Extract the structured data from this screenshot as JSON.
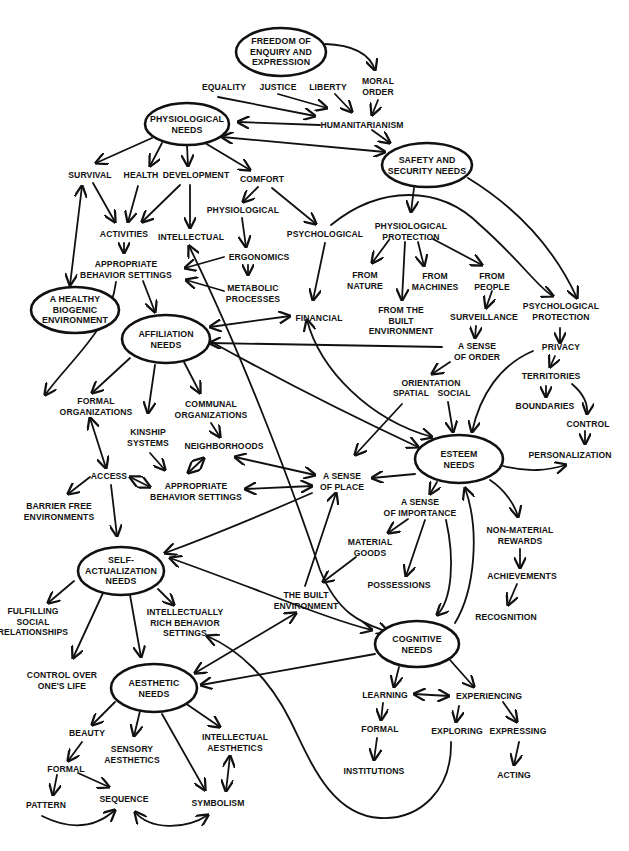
{
  "diagram": {
    "title": "",
    "colors": {
      "ink": "#111111",
      "background": "#ffffff"
    },
    "needs": {
      "freedom": "FREEDOM OF\nENQUIRY AND\nEXPRESSION",
      "physiological": "PHYSIOLOGICAL\nNEEDS",
      "safety": "SAFETY AND\nSECURITY NEEDS",
      "healthy_env": "A HEALTHY\nBIOGENIC\nENVIRONMENT",
      "affiliation": "AFFILIATION\nNEEDS",
      "esteem": "ESTEEM\nNEEDS",
      "self_actualization": "SELF-\nACTUALIZATION\nNEEDS",
      "cognitive": "COGNITIVE\nNEEDS",
      "aesthetic": "AESTHETIC\nNEEDS"
    },
    "labels": {
      "equality": "EQUALITY",
      "justice": "JUSTICE",
      "liberty": "LIBERTY",
      "moral_order": "MORAL\nORDER",
      "humanitarianism": "HUMANITARIANISM",
      "survival": "SURVIVAL",
      "health": "HEALTH",
      "development": "DEVELOPMENT",
      "comfort": "COMFORT",
      "comfort_physiological": "PHYSIOLOGICAL",
      "comfort_psychological": "PSYCHOLOGICAL",
      "activities": "ACTIVITIES",
      "intellectual": "INTELLECTUAL",
      "ergonomics": "ERGONOMICS",
      "metabolic": "METABOLIC\nPROCESSES",
      "appropriate_behavior_1": "APPROPRIATE\nBEHAVIOR SETTINGS",
      "financial": "FINANCIAL",
      "physiological_protection": "PHYSIOLOGICAL\nPROTECTION",
      "from_nature": "FROM\nNATURE",
      "from_built": "FROM THE\nBUILT\nENVIRONMENT",
      "from_machines": "FROM\nMACHINES",
      "from_people": "FROM\nPEOPLE",
      "surveillance": "SURVEILLANCE",
      "psychological_protection": "PSYCHOLOGICAL\nPROTECTION",
      "privacy": "PRIVACY",
      "territories": "TERRITORIES",
      "boundaries": "BOUNDARIES",
      "control": "CONTROL",
      "personalization": "PERSONALIZATION",
      "sense_of_order": "A SENSE\nOF ORDER",
      "orientation": "ORIENTATION",
      "spatial": "SPATIAL",
      "social": "SOCIAL",
      "formal_organizations": "FORMAL\nORGANIZATIONS",
      "communal_organizations": "COMMUNAL\nORGANIZATIONS",
      "kinship": "KINSHIP\nSYSTEMS",
      "neighborhoods": "NEIGHBORHOODS",
      "access": "ACCESS",
      "appropriate_behavior_2": "APPROPRIATE\nBEHAVIOR SETTINGS",
      "barrier_free": "BARRIER FREE\nENVIRONMENTS",
      "sense_of_place": "A SENSE\nOF PLACE",
      "sense_of_importance": "A SENSE\nOF IMPORTANCE",
      "material_goods": "MATERIAL\nGOODS",
      "possessions": "POSSESSIONS",
      "non_material": "NON-MATERIAL\nREWARDS",
      "achievements": "ACHIEVEMENTS",
      "recognition": "RECOGNITION",
      "built_environment": "THE BUILT\nENVIRONMENT",
      "fulfilling": "FULFILLING\nSOCIAL\nRELATIONSHIPS",
      "intellectually_rich": "INTELLECTUALLY\nRICH BEHAVIOR\nSETTINGS",
      "control_life": "CONTROL OVER\nONE'S LIFE",
      "learning": "LEARNING",
      "experiencing": "EXPERIENCING",
      "formal_learning": "FORMAL",
      "institutions": "INSTITUTIONS",
      "exploring": "EXPLORING",
      "expressing": "EXPRESSING",
      "acting": "ACTING",
      "beauty": "BEAUTY",
      "sensory_aesthetics": "SENSORY\nAESTHETICS",
      "intellectual_aesthetics": "INTELLECTUAL\nAESTHETICS",
      "formal_aesthetic": "FORMAL",
      "pattern": "PATTERN",
      "sequence": "SEQUENCE",
      "symbolism": "SYMBOLISM"
    }
  }
}
